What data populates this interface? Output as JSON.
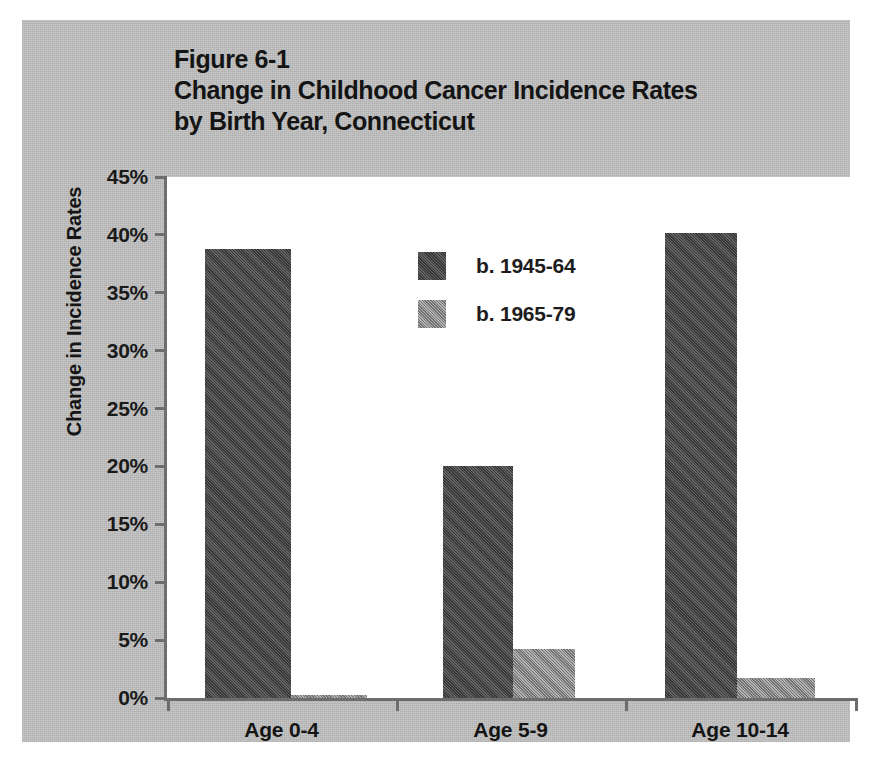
{
  "figure": {
    "label": "Figure 6-1",
    "title_line_1": "Change in Childhood Cancer Incidence Rates",
    "title_line_2": "by Birth Year, Connecticut"
  },
  "colors": {
    "panel_background": "#c2c2c2",
    "plot_background": "#ffffff",
    "axis": "#6d6d6d",
    "series_1": "#4f4f4f",
    "series_2": "#929292",
    "text": "#141414"
  },
  "chart_data": {
    "type": "bar",
    "title": "Figure 6-1 Change in Childhood Cancer Incidence Rates by Birth Year, Connecticut",
    "xlabel": "",
    "ylabel": "Change in Incidence Rates",
    "categories": [
      "Age 0-4",
      "Age 5-9",
      "Age 10-14"
    ],
    "series": [
      {
        "name": "b. 1945-64",
        "color": "#4f4f4f",
        "values": [
          38.8,
          20.0,
          40.2
        ]
      },
      {
        "name": "b. 1965-79",
        "color": "#929292",
        "values": [
          0.3,
          4.2,
          1.7
        ]
      }
    ],
    "ylim": [
      0,
      45
    ],
    "yticks": [
      0,
      5,
      10,
      15,
      20,
      25,
      30,
      35,
      40,
      45
    ],
    "ytick_labels": [
      "0%",
      "5%",
      "10%",
      "15%",
      "20%",
      "25%",
      "30%",
      "35%",
      "40%",
      "45%"
    ],
    "grid": false,
    "legend_position": "upper center",
    "value_unit": "%"
  }
}
